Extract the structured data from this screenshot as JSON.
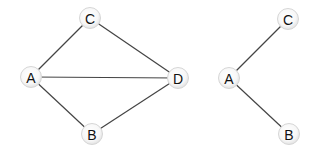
{
  "graphs": [
    {
      "name": "full-graph",
      "nodes": [
        {
          "id": "A",
          "label": "A",
          "x": 31,
          "y": 77
        },
        {
          "id": "B",
          "label": "B",
          "x": 92,
          "y": 134
        },
        {
          "id": "C",
          "label": "C",
          "x": 90,
          "y": 18
        },
        {
          "id": "D",
          "label": "D",
          "x": 178,
          "y": 78
        }
      ],
      "edges": [
        {
          "from": "A",
          "to": "C"
        },
        {
          "from": "A",
          "to": "D"
        },
        {
          "from": "A",
          "to": "B"
        },
        {
          "from": "C",
          "to": "D"
        },
        {
          "from": "B",
          "to": "D"
        }
      ]
    },
    {
      "name": "subgraph",
      "nodes": [
        {
          "id": "A",
          "label": "A",
          "x": 229,
          "y": 78
        },
        {
          "id": "B",
          "label": "B",
          "x": 289,
          "y": 134
        },
        {
          "id": "C",
          "label": "C",
          "x": 288,
          "y": 19
        }
      ],
      "edges": [
        {
          "from": "A",
          "to": "C"
        },
        {
          "from": "A",
          "to": "B"
        }
      ]
    }
  ],
  "colors": {
    "edge": "#444444",
    "node_fill_center": "#ffffff",
    "node_fill_edge": "#e6e6e6",
    "node_stroke": "#d6d6d6",
    "label": "#111111"
  }
}
